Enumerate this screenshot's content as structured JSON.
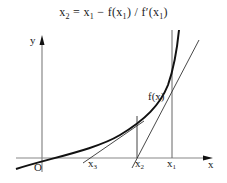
{
  "formula": {
    "lhs": "x",
    "lhs_sub": "2",
    "eq": " = x",
    "x1_sub": "1",
    "minus": " − f(x",
    "f_sub": "1",
    "div": ") / f′(x",
    "fp_sub": "1",
    "close": ")"
  },
  "axes": {
    "x_label": "x",
    "y_label": "y",
    "origin_label": "O"
  },
  "curve_label": "f(x)",
  "points": [
    {
      "name": "x",
      "sub": "3"
    },
    {
      "name": "x",
      "sub": "2"
    },
    {
      "name": "x",
      "sub": "1"
    }
  ],
  "colors": {
    "axis": "#888888",
    "curve": "#111111",
    "tangent": "#333333",
    "text": "#222222"
  }
}
